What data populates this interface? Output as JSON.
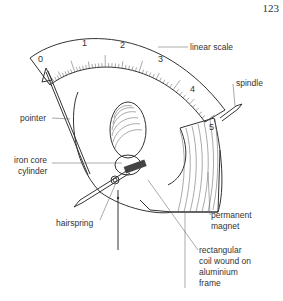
{
  "page_number": "123",
  "diagram": {
    "scale_numbers": [
      "0",
      "1",
      "2",
      "3",
      "4",
      "5"
    ],
    "labels": {
      "linear_scale": "linear scale",
      "spindle": "spindle",
      "pointer": "pointer",
      "iron_core_1": "iron core",
      "iron_core_2": "cylinder",
      "hairspring": "hairspring",
      "magnet_1": "permanent",
      "magnet_2": "magnet",
      "coil_1": "rectangular",
      "coil_2": "coil wound on",
      "coil_3": "aluminium",
      "coil_4": "frame"
    }
  }
}
